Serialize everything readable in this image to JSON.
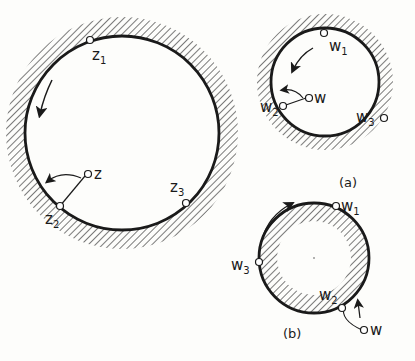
{
  "figure": {
    "colors": {
      "ink": "#1a1a1a",
      "background": "#fdfdfb"
    },
    "left_diagram": {
      "description": "z-plane: disk with hatched exterior",
      "points": [
        {
          "name": "z1",
          "base": "z",
          "sub": "1"
        },
        {
          "name": "z2",
          "base": "z",
          "sub": "2"
        },
        {
          "name": "z3",
          "base": "z",
          "sub": "3"
        },
        {
          "name": "z",
          "base": "z",
          "sub": ""
        }
      ]
    },
    "diagram_a": {
      "caption": "(a)",
      "points": [
        {
          "name": "w1",
          "base": "w",
          "sub": "1"
        },
        {
          "name": "w2",
          "base": "w",
          "sub": "2"
        },
        {
          "name": "w3",
          "base": "w",
          "sub": "3"
        },
        {
          "name": "w",
          "base": "w",
          "sub": ""
        }
      ]
    },
    "diagram_b": {
      "caption": "(b)",
      "points": [
        {
          "name": "w1",
          "base": "w",
          "sub": "1"
        },
        {
          "name": "w2",
          "base": "w",
          "sub": "2"
        },
        {
          "name": "w3",
          "base": "w",
          "sub": "3"
        },
        {
          "name": "w",
          "base": "w",
          "sub": ""
        }
      ]
    }
  }
}
